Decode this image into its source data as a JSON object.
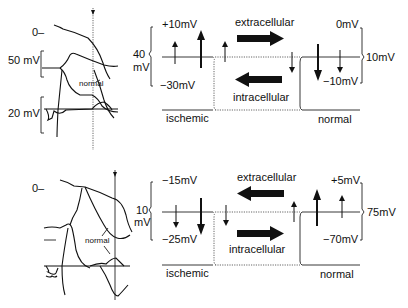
{
  "panels": [
    {
      "id": "top",
      "left_traces": {
        "zero_label": "0–",
        "scale_upper": "50 mV",
        "scale_lower": "20 mV",
        "annotation": "normal"
      },
      "schematic": {
        "left_scale": "40\nmV",
        "left_scale_line1": "40",
        "left_scale_line2": "mV",
        "ischemic_top": "+10mV",
        "ischemic_bottom": "−30mV",
        "normal_top": "0mV",
        "normal_bottom": "−10mV",
        "right_scale": "10mV",
        "extracellular_label": "extracellular",
        "intracellular_label": "intracellular",
        "extracellular_arrow": "right",
        "intracellular_arrow": "left",
        "ischemic_label": "ischemic",
        "normal_label": "normal"
      }
    },
    {
      "id": "bottom",
      "left_traces": {
        "zero_label": "0–",
        "annotation": "normal"
      },
      "schematic": {
        "left_scale_line1": "10",
        "left_scale_line2": "mV",
        "ischemic_top": "−15mV",
        "ischemic_bottom": "−25mV",
        "normal_top": "+5mV",
        "normal_bottom": "−70mV",
        "right_scale": "75mV",
        "extracellular_label": "extracellular",
        "intracellular_label": "intracellular",
        "extracellular_arrow": "left",
        "intracellular_arrow": "right",
        "ischemic_label": "ischemic",
        "normal_label": "normal"
      }
    }
  ]
}
